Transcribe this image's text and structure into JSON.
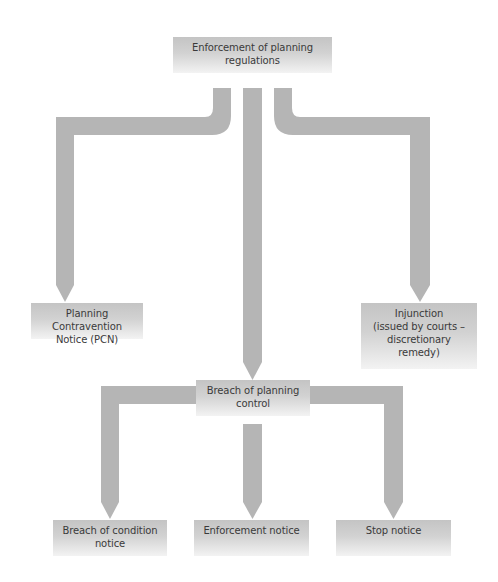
{
  "diagram": {
    "title": "Enforcement of planning regulations",
    "nodes": {
      "root": {
        "label": "Enforcement of planning\nregulations"
      },
      "pcn": {
        "label": "Planning Contravention\nNotice (PCN)"
      },
      "breach": {
        "label": "Breach of planning\ncontrol"
      },
      "injunction": {
        "label": "Injunction\n(issued by courts –\ndiscretionary\nremedy)"
      },
      "breach_condition": {
        "label": "Breach of condition\nnotice"
      },
      "enforcement_notice": {
        "label": "Enforcement notice"
      },
      "stop_notice": {
        "label": "Stop notice"
      }
    },
    "edges": [
      {
        "from": "root",
        "to": "pcn"
      },
      {
        "from": "root",
        "to": "breach"
      },
      {
        "from": "root",
        "to": "injunction"
      },
      {
        "from": "breach",
        "to": "breach_condition"
      },
      {
        "from": "breach",
        "to": "enforcement_notice"
      },
      {
        "from": "breach",
        "to": "stop_notice"
      }
    ],
    "colors": {
      "arrow": "#b3b3b3",
      "box_top": "#c4c4c4",
      "box_bottom": "#f3f3f3",
      "text": "#3a3a3a"
    }
  }
}
